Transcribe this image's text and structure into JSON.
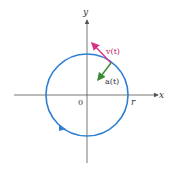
{
  "diagram": {
    "title": "",
    "axes": {
      "x_label": "x",
      "y_label": "y",
      "origin_label": "0",
      "radius_label": "r"
    },
    "circle": {
      "color": "#2e7fd0",
      "direction": "counterclockwise"
    },
    "vectors": [
      {
        "name": "velocity",
        "label": "v(t)",
        "color": "#d63384"
      },
      {
        "name": "acceleration",
        "label": "a(t)",
        "color": "#3a8a3a"
      }
    ]
  }
}
